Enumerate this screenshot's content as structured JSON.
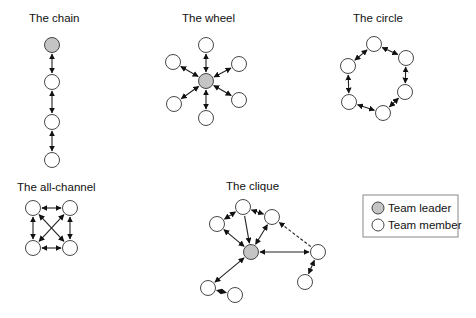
{
  "colors": {
    "leader_fill": "#c4c4c4",
    "member_fill": "#ffffff",
    "stroke": "#333333",
    "legend_border": "#888888"
  },
  "node_radius": 7.5,
  "networks": [
    {
      "id": "chain",
      "title": "The chain",
      "title_pos": [
        29,
        22
      ],
      "nodes": [
        {
          "id": "n1",
          "x": 52,
          "y": 45,
          "role": "leader"
        },
        {
          "id": "n2",
          "x": 52,
          "y": 82,
          "role": "member"
        },
        {
          "id": "n3",
          "x": 52,
          "y": 122,
          "role": "member"
        },
        {
          "id": "n4",
          "x": 52,
          "y": 160,
          "role": "member"
        }
      ],
      "edges": [
        {
          "from": "n1",
          "to": "n2",
          "style": "solid",
          "arrows": "both"
        },
        {
          "from": "n2",
          "to": "n3",
          "style": "solid",
          "arrows": "both"
        },
        {
          "from": "n3",
          "to": "n4",
          "style": "solid",
          "arrows": "both"
        }
      ]
    },
    {
      "id": "wheel",
      "title": "The wheel",
      "title_pos": [
        182,
        22
      ],
      "nodes": [
        {
          "id": "c",
          "x": 206,
          "y": 81,
          "role": "leader"
        },
        {
          "id": "t",
          "x": 206,
          "y": 45,
          "role": "member"
        },
        {
          "id": "tr",
          "x": 239,
          "y": 64,
          "role": "member"
        },
        {
          "id": "br",
          "x": 239,
          "y": 100,
          "role": "member"
        },
        {
          "id": "b",
          "x": 206,
          "y": 118,
          "role": "member"
        },
        {
          "id": "bl",
          "x": 174,
          "y": 104,
          "role": "member"
        },
        {
          "id": "tl",
          "x": 173,
          "y": 62,
          "role": "member"
        }
      ],
      "edges": [
        {
          "from": "c",
          "to": "t",
          "style": "solid",
          "arrows": "both"
        },
        {
          "from": "c",
          "to": "tr",
          "style": "solid",
          "arrows": "both"
        },
        {
          "from": "c",
          "to": "br",
          "style": "solid",
          "arrows": "both"
        },
        {
          "from": "c",
          "to": "b",
          "style": "solid",
          "arrows": "both"
        },
        {
          "from": "c",
          "to": "bl",
          "style": "solid",
          "arrows": "both"
        },
        {
          "from": "c",
          "to": "tl",
          "style": "solid",
          "arrows": "both"
        }
      ]
    },
    {
      "id": "circle",
      "title": "The circle",
      "title_pos": [
        353,
        22
      ],
      "nodes": [
        {
          "id": "a",
          "x": 374,
          "y": 44,
          "role": "member"
        },
        {
          "id": "b",
          "x": 406,
          "y": 58,
          "role": "member"
        },
        {
          "id": "c",
          "x": 405,
          "y": 92,
          "role": "member"
        },
        {
          "id": "d",
          "x": 383,
          "y": 113,
          "role": "member"
        },
        {
          "id": "e",
          "x": 349,
          "y": 102,
          "role": "member"
        },
        {
          "id": "f",
          "x": 348,
          "y": 66,
          "role": "member"
        }
      ],
      "edges": [
        {
          "from": "a",
          "to": "b",
          "style": "solid",
          "arrows": "both"
        },
        {
          "from": "b",
          "to": "c",
          "style": "solid",
          "arrows": "both"
        },
        {
          "from": "c",
          "to": "d",
          "style": "solid",
          "arrows": "both"
        },
        {
          "from": "d",
          "to": "e",
          "style": "solid",
          "arrows": "both"
        },
        {
          "from": "e",
          "to": "f",
          "style": "solid",
          "arrows": "both"
        },
        {
          "from": "f",
          "to": "a",
          "style": "solid",
          "arrows": "both"
        }
      ]
    },
    {
      "id": "all-channel",
      "title": "The all-channel",
      "title_pos": [
        17,
        191
      ],
      "nodes": [
        {
          "id": "tl",
          "x": 33,
          "y": 208,
          "role": "member"
        },
        {
          "id": "tr",
          "x": 70,
          "y": 208,
          "role": "member"
        },
        {
          "id": "bl",
          "x": 33,
          "y": 248,
          "role": "member"
        },
        {
          "id": "br",
          "x": 70,
          "y": 248,
          "role": "member"
        }
      ],
      "edges": [
        {
          "from": "tl",
          "to": "tr",
          "style": "solid",
          "arrows": "both"
        },
        {
          "from": "bl",
          "to": "br",
          "style": "solid",
          "arrows": "both"
        },
        {
          "from": "tl",
          "to": "bl",
          "style": "solid",
          "arrows": "both"
        },
        {
          "from": "tr",
          "to": "br",
          "style": "solid",
          "arrows": "both"
        },
        {
          "from": "tl",
          "to": "br",
          "style": "solid",
          "arrows": "both"
        },
        {
          "from": "tr",
          "to": "bl",
          "style": "solid",
          "arrows": "both"
        }
      ]
    },
    {
      "id": "clique",
      "title": "The clique",
      "title_pos": [
        226,
        190
      ],
      "nodes": [
        {
          "id": "L",
          "x": 251,
          "y": 252,
          "role": "leader"
        },
        {
          "id": "A",
          "x": 217,
          "y": 224,
          "role": "member"
        },
        {
          "id": "B",
          "x": 243,
          "y": 207,
          "role": "member"
        },
        {
          "id": "C",
          "x": 272,
          "y": 217,
          "role": "member"
        },
        {
          "id": "D",
          "x": 318,
          "y": 252,
          "role": "member"
        },
        {
          "id": "E",
          "x": 305,
          "y": 282,
          "role": "member"
        },
        {
          "id": "F",
          "x": 208,
          "y": 288,
          "role": "member"
        },
        {
          "id": "G",
          "x": 235,
          "y": 295,
          "role": "member"
        }
      ],
      "edges": [
        {
          "from": "A",
          "to": "B",
          "style": "solid",
          "arrows": "both"
        },
        {
          "from": "B",
          "to": "C",
          "style": "solid",
          "arrows": "both"
        },
        {
          "from": "A",
          "to": "L",
          "style": "solid",
          "arrows": "both"
        },
        {
          "from": "B",
          "to": "L",
          "style": "solid",
          "arrows": "end"
        },
        {
          "from": "C",
          "to": "L",
          "style": "solid",
          "arrows": "both"
        },
        {
          "from": "L",
          "to": "D",
          "style": "solid",
          "arrows": "both"
        },
        {
          "from": "D",
          "to": "C",
          "style": "dashed",
          "arrows": "end"
        },
        {
          "from": "D",
          "to": "E",
          "style": "solid",
          "arrows": "both"
        },
        {
          "from": "L",
          "to": "F",
          "style": "solid",
          "arrows": "both"
        },
        {
          "from": "F",
          "to": "G",
          "style": "solid",
          "arrows": "both"
        }
      ]
    }
  ],
  "legend": {
    "box": {
      "x": 363,
      "y": 195,
      "w": 95,
      "h": 42
    },
    "items": [
      {
        "label": "Team leader",
        "role": "leader",
        "cx": 378,
        "cy": 208
      },
      {
        "label": "Team member",
        "role": "member",
        "cx": 378,
        "cy": 225
      }
    ]
  }
}
